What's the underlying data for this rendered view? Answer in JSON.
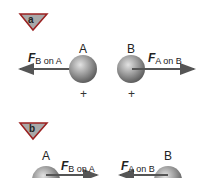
{
  "panels": [
    {
      "badge": "a",
      "spheres": [
        {
          "label": "A",
          "charge": "+"
        },
        {
          "label": "B",
          "charge": "+"
        }
      ],
      "forces": [
        {
          "symbol": "F",
          "subscript": "B on A",
          "direction": "left"
        },
        {
          "symbol": "F",
          "subscript": "A on B",
          "direction": "right"
        }
      ]
    },
    {
      "badge": "b",
      "spheres": [
        {
          "label": "A"
        },
        {
          "label": "B"
        }
      ],
      "forces": [
        {
          "symbol": "F",
          "subscript": "B on A",
          "direction": "right"
        },
        {
          "symbol": "F",
          "subscript": "A on B",
          "direction": "left"
        }
      ]
    }
  ],
  "colors": {
    "badge_fill": "#a8a8a8",
    "badge_border": "#8a1a1a",
    "arrow": "#555555",
    "sphere_light": "#d8d8d8",
    "sphere_dark": "#6a6a6a"
  }
}
